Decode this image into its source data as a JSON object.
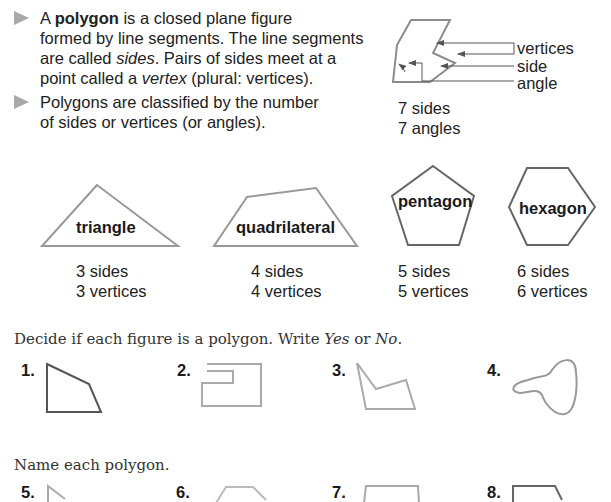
{
  "intro": {
    "bullet1": {
      "prefix": "A ",
      "term": "polygon",
      "line1_rest": " is a closed plane figure",
      "line2": "formed by line segments. The line segments",
      "line3_a": "are called ",
      "line3_em": "sides",
      "line3_b": ". Pairs of sides meet at a",
      "line4_a": "point called a ",
      "line4_em": "vertex",
      "line4_b": " (plural: vertices)."
    },
    "bullet2": {
      "line1": "Polygons are classified by the number",
      "line2": "of sides or vertices (or angles)."
    }
  },
  "diagram": {
    "labels": {
      "vertices": "vertices",
      "side": "side",
      "angle": "angle"
    },
    "counts": {
      "sides": "7 sides",
      "angles": "7 angles"
    }
  },
  "shapes": [
    {
      "name": "triangle",
      "sides": "3 sides",
      "vertices": "3 vertices"
    },
    {
      "name": "quadrilateral",
      "sides": "4 sides",
      "vertices": "4 vertices"
    },
    {
      "name": "pentagon",
      "sides": "5 sides",
      "vertices": "5 vertices"
    },
    {
      "name": "hexagon",
      "sides": "6 sides",
      "vertices": "6 vertices"
    }
  ],
  "exercise1": {
    "instruction_a": "Decide if each figure is a polygon. Write ",
    "yes": "Yes",
    "instruction_or": " or ",
    "no": "No",
    "instruction_end": ".",
    "items": [
      {
        "num": "1."
      },
      {
        "num": "2."
      },
      {
        "num": "3."
      },
      {
        "num": "4."
      }
    ]
  },
  "exercise2": {
    "instruction": "Name each polygon.",
    "items": [
      {
        "num": "5."
      },
      {
        "num": "6."
      },
      {
        "num": "7."
      },
      {
        "num": "8."
      }
    ]
  },
  "colors": {
    "shape_stroke": "#8c8c8c",
    "dark_stroke": "#555555",
    "bullet": "#a9a9a9"
  }
}
